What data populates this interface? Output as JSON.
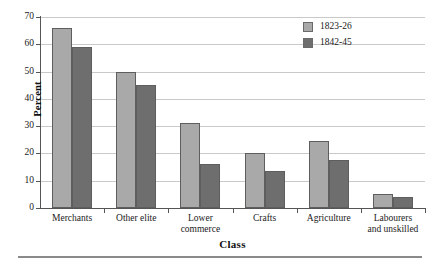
{
  "chart_data": {
    "type": "bar",
    "title": "",
    "xlabel": "Class",
    "ylabel": "Percent",
    "categories": [
      "Merchants",
      "Other elite",
      "Lower\ncommerce",
      "Crafts",
      "Agriculture",
      "Labourers\nand unskilled"
    ],
    "series": [
      {
        "name": "1823-26",
        "color": "#a9a9a9",
        "values": [
          66,
          50,
          31,
          20,
          24.5,
          5
        ]
      },
      {
        "name": "1842-45",
        "color": "#6e6e6e",
        "values": [
          59,
          45,
          16,
          13.5,
          17.5,
          4
        ]
      }
    ],
    "ylim": [
      0,
      70
    ],
    "yticks": [
      0,
      10,
      20,
      30,
      40,
      50,
      60,
      70
    ],
    "ytick_labels": [
      "0",
      "10",
      "20",
      "30",
      "40",
      "50",
      "60",
      "70"
    ],
    "grid": true,
    "grid_axis": "y",
    "legend_position": "top-right"
  },
  "figure": {
    "background": "#ffffff",
    "axis_color": "#555555",
    "grid_color": "#c9c9c9",
    "rule_color": "#8a8a8a"
  }
}
